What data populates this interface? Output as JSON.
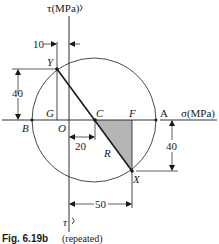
{
  "figure": {
    "caption_label": "Fig. 6.19b",
    "caption_note": "(repeated)",
    "axes": {
      "sigma_label": "σ(MPa)",
      "tau_top_label": "τ(MPa)",
      "tau_bottom_label": "τ"
    },
    "points": {
      "Y": "Y",
      "X": "X",
      "C": "C",
      "F": "F",
      "A": "A",
      "B": "B",
      "G": "G",
      "O": "O",
      "R": "R"
    },
    "dimensions": {
      "top_offset": "10",
      "y_height": "40",
      "oc": "20",
      "x_height": "40",
      "x_offset": "50"
    },
    "colors": {
      "line": "#1a1a1a",
      "shade": "#b5b5b5"
    }
  }
}
